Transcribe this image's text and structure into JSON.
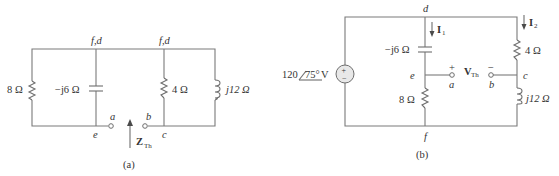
{
  "figure": {
    "panel_a": {
      "caption": "(a)",
      "node_labels": {
        "top_left": "f,d",
        "top_right": "f,d",
        "bottom_left": "e",
        "bottom_right": "c"
      },
      "terminals": {
        "left": "a",
        "right": "b"
      },
      "components": {
        "resistor_8": "8 Ω",
        "capacitor": "−j6 Ω",
        "resistor_4": "4 Ω",
        "inductor": "j12 Ω"
      },
      "impedance_label_main": "Z",
      "impedance_label_sub": "Th"
    },
    "panel_b": {
      "caption": "(b)",
      "node_labels": {
        "top": "d",
        "bottom": "f",
        "left_mid": "e",
        "right_mid": "c"
      },
      "terminals": {
        "left": "a",
        "right": "b",
        "plus": "+",
        "minus": "−"
      },
      "source": {
        "magnitude": "120",
        "angle": "75°",
        "unit": " V",
        "plus": "+",
        "minus": "−"
      },
      "currents": {
        "i1_main": "I",
        "i1_sub": "1",
        "i2_main": "I",
        "i2_sub": "2"
      },
      "voltage_main": "V",
      "voltage_sub": "Th",
      "components": {
        "capacitor": "−j6 Ω",
        "resistor_8": "8 Ω",
        "resistor_4": "4 Ω",
        "inductor": "j12 Ω"
      }
    }
  }
}
